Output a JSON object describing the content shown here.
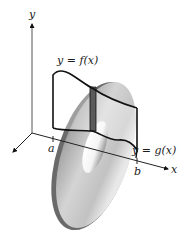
{
  "figure": {
    "type": "solid-of-revolution-washer",
    "axes": {
      "y_label": "y",
      "x_label": "x"
    },
    "ticks": {
      "a": "a",
      "b": "b"
    },
    "curves": {
      "upper": "y = f(x)",
      "lower": "y = g(x)"
    },
    "colors": {
      "axis": "#222222",
      "curve": "#111111",
      "strip": "#555555",
      "washer_light": "#e6e6e6",
      "washer_mid": "#bdbdbd",
      "washer_dark": "#6e6e6e"
    }
  }
}
